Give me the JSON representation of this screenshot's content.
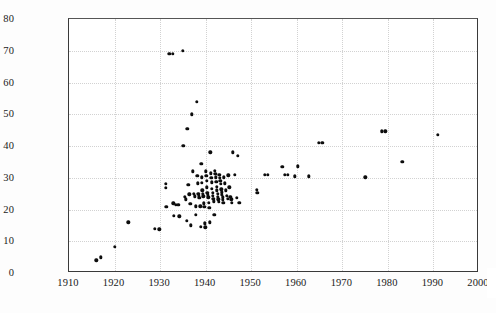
{
  "chart_data": {
    "type": "scatter",
    "title": "",
    "xlabel": "",
    "ylabel": "MPH (on roads)",
    "xlim": [
      1910,
      2000
    ],
    "ylim": [
      0,
      80
    ],
    "xticks": [
      1910,
      1920,
      1930,
      1940,
      1950,
      1960,
      1970,
      1980,
      1990,
      2000
    ],
    "yticks": [
      0,
      10,
      20,
      30,
      40,
      50,
      60,
      70,
      80
    ],
    "xtick_labels": [
      "1910",
      "1920",
      "1930",
      "1940",
      "1950",
      "1960",
      "1970",
      "1980",
      "1990",
      "2000"
    ],
    "ytick_labels": [
      "0",
      "10",
      "20",
      "30",
      "40",
      "50",
      "60",
      "70",
      "80"
    ],
    "grid": true,
    "grid_style": "dotted",
    "grid_color": "#d2d2d2",
    "legend": false,
    "marker_color": "#0d0d0d",
    "marker_size": 3.4,
    "note_rightmost_tick_clipped": "2000",
    "series": [
      {
        "name": "records",
        "points": [
          [
            1916.0,
            4.0
          ],
          [
            1917.0,
            5.0
          ],
          [
            1920.0,
            8.2
          ],
          [
            1923.0,
            16.0
          ],
          [
            1928.8,
            14.0
          ],
          [
            1929.8,
            13.8
          ],
          [
            1931.2,
            28.0
          ],
          [
            1931.3,
            26.8
          ],
          [
            1931.4,
            20.8
          ],
          [
            1932.0,
            69.0
          ],
          [
            1932.8,
            69.0
          ],
          [
            1932.9,
            22.0
          ],
          [
            1933.0,
            18.0
          ],
          [
            1933.4,
            21.4
          ],
          [
            1934.0,
            21.4
          ],
          [
            1934.2,
            17.8
          ],
          [
            1935.0,
            70.0
          ],
          [
            1935.1,
            40.0
          ],
          [
            1935.4,
            24.0
          ],
          [
            1935.6,
            23.2
          ],
          [
            1935.8,
            16.5
          ],
          [
            1936.0,
            45.5
          ],
          [
            1936.2,
            27.8
          ],
          [
            1936.4,
            24.8
          ],
          [
            1936.6,
            21.8
          ],
          [
            1936.8,
            15.0
          ],
          [
            1937.0,
            50.0
          ],
          [
            1937.2,
            32.0
          ],
          [
            1937.4,
            25.0
          ],
          [
            1937.6,
            24.2
          ],
          [
            1937.8,
            21.0
          ],
          [
            1937.9,
            18.4
          ],
          [
            1938.0,
            54.0
          ],
          [
            1938.2,
            30.6
          ],
          [
            1938.3,
            28.2
          ],
          [
            1938.4,
            25.0
          ],
          [
            1938.5,
            24.4
          ],
          [
            1938.6,
            23.6
          ],
          [
            1938.8,
            21.0
          ],
          [
            1938.9,
            14.6
          ],
          [
            1939.0,
            34.4
          ],
          [
            1939.1,
            30.2
          ],
          [
            1939.2,
            28.4
          ],
          [
            1939.3,
            26.0
          ],
          [
            1939.4,
            25.0
          ],
          [
            1939.5,
            24.2
          ],
          [
            1939.6,
            22.0
          ],
          [
            1939.7,
            20.8
          ],
          [
            1939.8,
            15.6
          ],
          [
            1939.9,
            14.4
          ],
          [
            1940.0,
            32.0
          ],
          [
            1940.1,
            30.6
          ],
          [
            1940.2,
            29.0
          ],
          [
            1940.3,
            27.0
          ],
          [
            1940.4,
            25.2
          ],
          [
            1940.5,
            24.6
          ],
          [
            1940.6,
            23.8
          ],
          [
            1940.7,
            22.2
          ],
          [
            1940.8,
            20.6
          ],
          [
            1940.9,
            16.0
          ],
          [
            1941.0,
            38.0
          ],
          [
            1941.1,
            31.4
          ],
          [
            1941.2,
            30.0
          ],
          [
            1941.3,
            28.6
          ],
          [
            1941.4,
            26.6
          ],
          [
            1941.5,
            25.2
          ],
          [
            1941.6,
            24.4
          ],
          [
            1941.7,
            23.4
          ],
          [
            1941.8,
            22.6
          ],
          [
            1941.9,
            18.4
          ],
          [
            1942.0,
            32.2
          ],
          [
            1942.1,
            31.2
          ],
          [
            1942.2,
            30.2
          ],
          [
            1942.3,
            28.8
          ],
          [
            1942.4,
            27.2
          ],
          [
            1942.5,
            26.0
          ],
          [
            1942.6,
            25.0
          ],
          [
            1942.7,
            24.0
          ],
          [
            1942.8,
            23.2
          ],
          [
            1942.9,
            22.4
          ],
          [
            1943.0,
            31.0
          ],
          [
            1943.1,
            30.0
          ],
          [
            1943.2,
            29.0
          ],
          [
            1943.3,
            28.0
          ],
          [
            1943.4,
            26.4
          ],
          [
            1943.5,
            25.4
          ],
          [
            1943.6,
            24.6
          ],
          [
            1943.7,
            23.8
          ],
          [
            1943.8,
            23.0
          ],
          [
            1943.9,
            22.2
          ],
          [
            1944.0,
            30.2
          ],
          [
            1944.2,
            28.2
          ],
          [
            1944.4,
            26.0
          ],
          [
            1944.6,
            24.4
          ],
          [
            1944.8,
            23.4
          ],
          [
            1945.0,
            30.8
          ],
          [
            1945.2,
            27.0
          ],
          [
            1945.4,
            24.0
          ],
          [
            1945.6,
            23.2
          ],
          [
            1945.8,
            22.2
          ],
          [
            1946.0,
            38.0
          ],
          [
            1946.4,
            31.0
          ],
          [
            1946.8,
            23.6
          ],
          [
            1947.0,
            37.0
          ],
          [
            1947.4,
            22.2
          ],
          [
            1951.2,
            26.2
          ],
          [
            1951.3,
            25.2
          ],
          [
            1953.0,
            31.0
          ],
          [
            1953.6,
            31.0
          ],
          [
            1956.8,
            33.4
          ],
          [
            1957.4,
            31.0
          ],
          [
            1958.0,
            31.0
          ],
          [
            1959.6,
            30.4
          ],
          [
            1960.2,
            33.6
          ],
          [
            1962.6,
            30.4
          ],
          [
            1964.8,
            41.0
          ],
          [
            1965.6,
            41.0
          ],
          [
            1975.0,
            30.2
          ],
          [
            1978.6,
            44.6
          ],
          [
            1979.4,
            44.6
          ],
          [
            1983.2,
            35.0
          ],
          [
            1991.0,
            43.6
          ]
        ]
      }
    ]
  }
}
